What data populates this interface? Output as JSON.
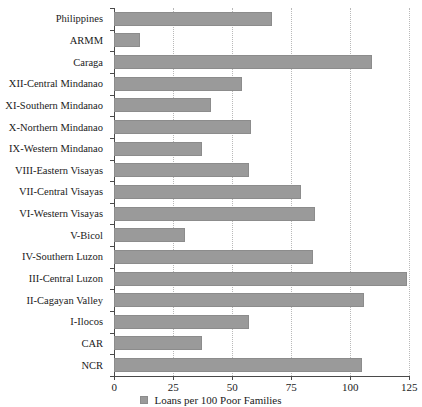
{
  "chart_data": {
    "type": "bar",
    "orientation": "horizontal",
    "title": "",
    "xlabel": "",
    "ylabel": "",
    "xlim": [
      0,
      125
    ],
    "xticks": [
      0,
      25,
      50,
      75,
      100,
      125
    ],
    "grid": true,
    "legend_position": "bottom-center",
    "legend": [
      "Loans per 100 Poor Families"
    ],
    "series_name": "Loans per 100 Poor Families",
    "categories": [
      "Philippines",
      "ARMM",
      "Caraga",
      "XII-Central Mindanao",
      "XI-Southern Mindanao",
      "X-Northern Mindanao",
      "IX-Western Mindanao",
      "VIII-Eastern Visayas",
      "VII-Central Visayas",
      "VI-Western Visayas",
      "V-Bicol",
      "IV-Southern Luzon",
      "III-Central Luzon",
      "II-Cagayan Valley",
      "I-Ilocos",
      "CAR",
      "NCR"
    ],
    "values": [
      67,
      11,
      109,
      54,
      41,
      58,
      37,
      57,
      79,
      85,
      30,
      84,
      124,
      106,
      57,
      37,
      105
    ],
    "bar_color": "#9a9a9a",
    "axis_color": "#4a4a4a",
    "gridline_color": "#b9b9b9"
  },
  "axis": {
    "tick_labels": [
      "0",
      "25",
      "50",
      "75",
      "100",
      "125"
    ]
  },
  "legend": {
    "label": "Loans per 100 Poor Families",
    "swatch_name": "legend-swatch"
  }
}
